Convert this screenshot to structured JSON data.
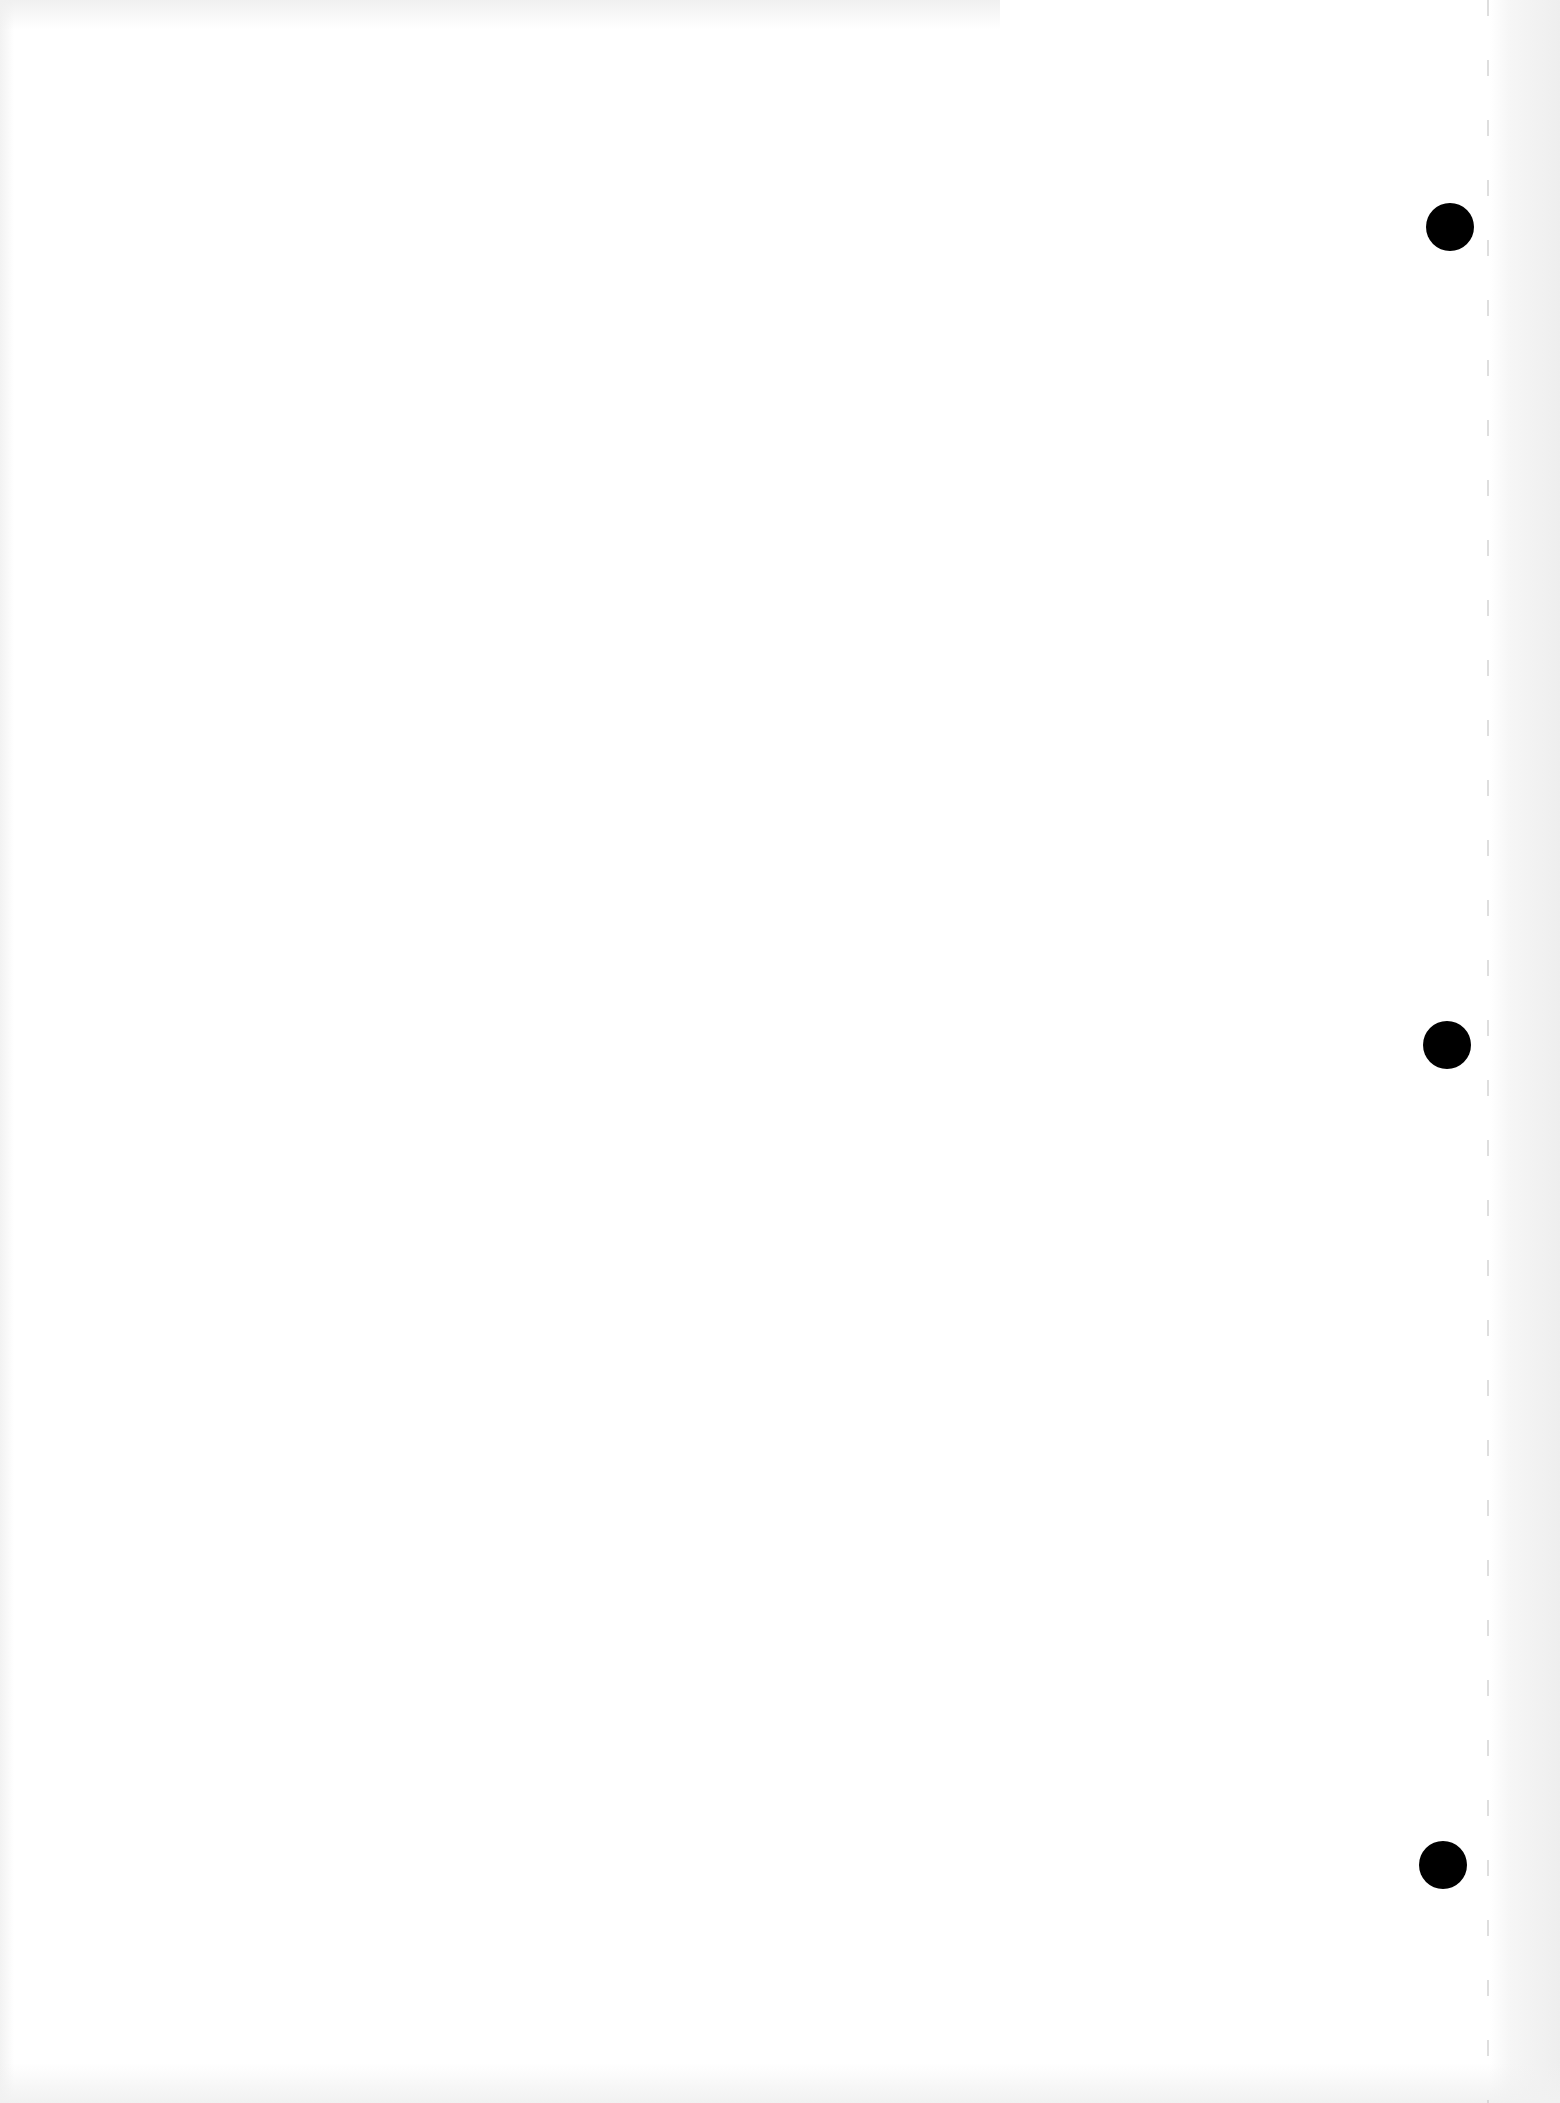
{
  "document": {
    "type": "blank scanned page",
    "text_content": "",
    "background_color": "#ffffff",
    "punch_holes": [
      {
        "cx": 1450,
        "cy": 227,
        "radius": 24,
        "color": "#000000"
      },
      {
        "cx": 1447,
        "cy": 1045,
        "radius": 24,
        "color": "#000000"
      },
      {
        "cx": 1443,
        "cy": 1865,
        "radius": 24,
        "color": "#000000"
      }
    ]
  }
}
